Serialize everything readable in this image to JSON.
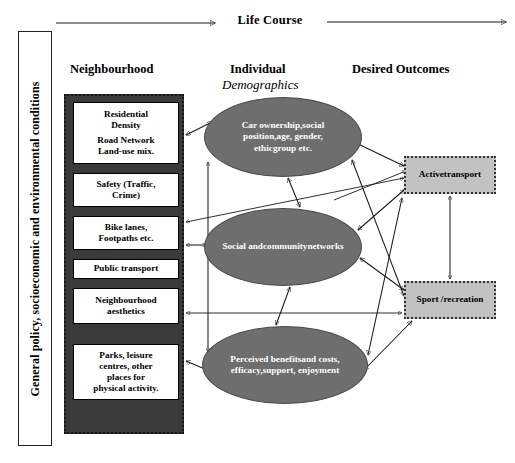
{
  "diagram": {
    "title_arrow_label": "Life Course",
    "context_band": {
      "label": "General policy, socioeconomic and environmental conditions"
    },
    "columns": {
      "neighbourhood": "Neighbourhood",
      "individual": "Individual",
      "individual_sub": "Demographics",
      "outcomes": "Desired Outcomes"
    },
    "neighbourhood_items": [
      {
        "lines": [
          "Residential",
          "Density",
          "",
          "Road Network",
          "Land-use mix."
        ]
      },
      {
        "lines": [
          "Safety (Traffic,",
          "Crime)"
        ]
      },
      {
        "lines": [
          "Bike lanes,",
          "Footpaths etc."
        ]
      },
      {
        "lines": [
          "Public transport"
        ]
      },
      {
        "lines": [
          "Neighbourhood",
          "aesthetics"
        ]
      },
      {
        "lines": [
          "Parks, leisure",
          "centres, other",
          "places for",
          "physical activity."
        ]
      }
    ],
    "individual_items": [
      {
        "lines": [
          "Car ownership,",
          "social position,",
          "age, gender, ethic",
          "group etc."
        ]
      },
      {
        "lines": [
          "Social and",
          "community",
          "networks"
        ]
      },
      {
        "lines": [
          "Perceived benefits",
          "and costs, efficacy,",
          "support, enjoyment"
        ]
      }
    ],
    "outcome_items": [
      {
        "lines": [
          "Active",
          "transport"
        ]
      },
      {
        "lines": [
          "Sport /",
          "recreation"
        ]
      }
    ],
    "colors": {
      "ellipse_fill": "#6e6e6e",
      "ellipse_text": "#ffffff",
      "outcome_fill": "#c2c2c2",
      "group_fill": "#3a3a3a",
      "box_fill": "#ffffff",
      "line": "#1a1a1a"
    }
  }
}
